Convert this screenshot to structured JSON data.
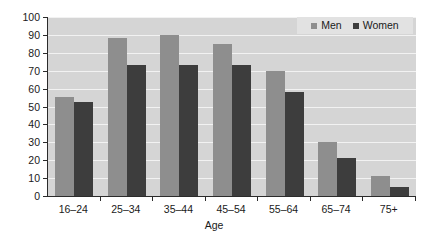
{
  "chart_data": {
    "type": "bar",
    "title": "",
    "xlabel": "Age",
    "ylabel": "Participation rate",
    "categories": [
      "16–24",
      "25–34",
      "35–44",
      "45–54",
      "55–64",
      "65–74",
      "75+"
    ],
    "series": [
      {
        "name": "Men",
        "color": "#8e8e8e",
        "values": [
          55.5,
          88,
          90,
          85,
          70,
          30,
          11
        ]
      },
      {
        "name": "Women",
        "color": "#3d3d3d",
        "values": [
          52.5,
          73,
          73,
          73,
          58,
          21.5,
          5
        ]
      }
    ],
    "ylim": [
      0,
      100
    ],
    "yticks": [
      0,
      10,
      20,
      30,
      40,
      50,
      60,
      70,
      80,
      90,
      100
    ],
    "ytick_labels": [
      "0",
      "10",
      "20",
      "30",
      "40",
      "50",
      "60",
      "70",
      "80",
      "90",
      "100"
    ],
    "grid": true,
    "grid_axis": "y",
    "legend_position": "top-right",
    "plot_background": "#d5d5d5",
    "gridline_color": "#f2f2f2",
    "axis_color": "#2b2b2b"
  },
  "legend": {
    "entries": [
      {
        "label": "Men"
      },
      {
        "label": "Women"
      }
    ]
  }
}
